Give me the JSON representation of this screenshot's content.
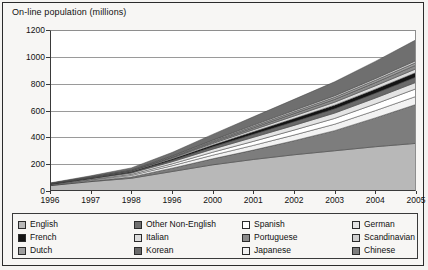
{
  "chart_data": {
    "type": "area",
    "title": "On-line population (millions)",
    "xlabel": "",
    "ylabel": "On-line population (millions)",
    "stacked": true,
    "grid": true,
    "legend_position": "bottom",
    "ylim": [
      0,
      1200
    ],
    "yticks": [
      0,
      200,
      400,
      600,
      800,
      1000,
      1200
    ],
    "ytick_labels": [
      "0",
      "200",
      "400",
      "600",
      "800",
      "1000",
      "1200"
    ],
    "x": [
      "1996",
      "1997",
      "1998",
      "1996",
      "2000",
      "2001",
      "2002",
      "2003",
      "2004",
      "2005"
    ],
    "xtick_labels": [
      "1996",
      "1997",
      "1998",
      "1996",
      "2000",
      "2001",
      "2002",
      "2003",
      "2004",
      "2005"
    ],
    "series": [
      {
        "name": "English",
        "color": "#b8b8b8",
        "values": [
          40,
          70,
          95,
          145,
          195,
          235,
          270,
          300,
          330,
          355
        ]
      },
      {
        "name": "Chinese",
        "color": "#7d7d7d",
        "values": [
          2,
          5,
          10,
          25,
          45,
          70,
          105,
          150,
          215,
          290
        ]
      },
      {
        "name": "Japanese",
        "color": "#f2f2f2",
        "values": [
          3,
          6,
          11,
          18,
          27,
          35,
          42,
          48,
          54,
          60
        ]
      },
      {
        "name": "Spanish",
        "color": "#ffffff",
        "values": [
          2,
          4,
          8,
          14,
          22,
          30,
          37,
          43,
          50,
          57
        ]
      },
      {
        "name": "German",
        "color": "#e4e4e4",
        "values": [
          3,
          6,
          10,
          16,
          23,
          30,
          35,
          40,
          44,
          48
        ]
      },
      {
        "name": "Korean",
        "color": "#6a6a6a",
        "values": [
          1,
          3,
          6,
          11,
          17,
          23,
          28,
          32,
          36,
          40
        ]
      },
      {
        "name": "French",
        "color": "#141414",
        "values": [
          1,
          3,
          5,
          9,
          14,
          19,
          23,
          27,
          30,
          33
        ]
      },
      {
        "name": "Italian",
        "color": "#dcdcdc",
        "values": [
          1,
          2,
          4,
          7,
          11,
          15,
          19,
          22,
          25,
          28
        ]
      },
      {
        "name": "Portuguese",
        "color": "#8c8c8c",
        "values": [
          1,
          2,
          3,
          6,
          10,
          14,
          18,
          21,
          24,
          27
        ]
      },
      {
        "name": "Dutch",
        "color": "#9e9e9e",
        "values": [
          1,
          2,
          3,
          5,
          8,
          11,
          13,
          15,
          17,
          19
        ]
      },
      {
        "name": "Scandinavian",
        "color": "#cfcfcf",
        "values": [
          1,
          2,
          3,
          5,
          7,
          9,
          11,
          12,
          13,
          15
        ]
      },
      {
        "name": "Other Non-English",
        "color": "#6f6f6f",
        "values": [
          4,
          8,
          14,
          26,
          43,
          62,
          82,
          104,
          128,
          155
        ]
      }
    ]
  },
  "legend": {
    "items": [
      {
        "label": "English",
        "swatch": "#b8b8b8"
      },
      {
        "label": "Other Non-English",
        "swatch": "#6f6f6f"
      },
      {
        "label": "Spanish",
        "swatch": "#ffffff"
      },
      {
        "label": "German",
        "swatch": "#e4e4e4"
      },
      {
        "label": "French",
        "swatch": "#141414"
      },
      {
        "label": "Italian",
        "swatch": "#dcdcdc"
      },
      {
        "label": "Portuguese",
        "swatch": "#8c8c8c"
      },
      {
        "label": "Scandinavian",
        "swatch": "#cfcfcf"
      },
      {
        "label": "Dutch",
        "swatch": "#9e9e9e"
      },
      {
        "label": "Korean",
        "swatch": "#6a6a6a"
      },
      {
        "label": "Japanese",
        "swatch": "#f2f2f2"
      },
      {
        "label": "Chinese",
        "swatch": "#7d7d7d"
      }
    ]
  }
}
